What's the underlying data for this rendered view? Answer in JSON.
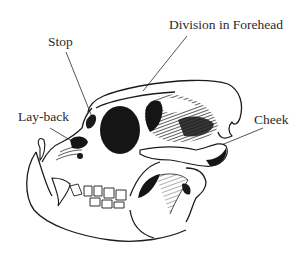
{
  "diagram": {
    "labels": [
      {
        "id": "division",
        "text": "Division in Forehead"
      },
      {
        "id": "stop",
        "text": "Stop"
      },
      {
        "id": "layback",
        "text": "Lay-back"
      },
      {
        "id": "cheek",
        "text": "Cheek"
      }
    ]
  },
  "colors": {
    "background": "#ffffff",
    "ink": "#1a1a1a",
    "label_text": "#2a2a2a"
  }
}
